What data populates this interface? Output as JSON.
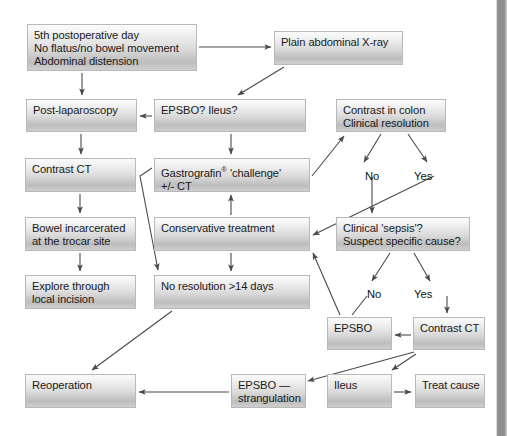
{
  "diagram": {
    "width": 507,
    "height": 436,
    "box_fill_top": "#fbfbfb",
    "box_fill_bottom": "#bdbdbd",
    "box_border": "#b9b9b9",
    "line_color": "#555555",
    "background": "#ffffff",
    "nodes": [
      {
        "id": "n1",
        "label": "5th postoperative day\nNo flatus/no bowel movement\nAbdominal distension",
        "x": 27,
        "y": 24,
        "w": 170,
        "h": 47
      },
      {
        "id": "n2",
        "label": "Plain abdominal X-ray",
        "x": 274,
        "y": 31,
        "w": 129,
        "h": 34
      },
      {
        "id": "n3",
        "label": "Post-laparoscopy",
        "x": 26,
        "y": 99,
        "w": 111,
        "h": 33
      },
      {
        "id": "n4",
        "label": "EPSBO? Ileus?",
        "x": 154,
        "y": 99,
        "w": 152,
        "h": 33
      },
      {
        "id": "n5",
        "label": "Contrast in colon\nClinical resolution",
        "x": 336,
        "y": 99,
        "w": 110,
        "h": 33
      },
      {
        "id": "n6",
        "label": "Contrast CT",
        "x": 25,
        "y": 158,
        "w": 111,
        "h": 34
      },
      {
        "id": "n7",
        "label": "Gastrografin® 'challenge'\n+/- CT",
        "x": 154,
        "y": 158,
        "w": 156,
        "h": 34,
        "sup": true
      },
      {
        "id": "n8",
        "label": "Bowel incarcerated\nat the trocar site",
        "x": 25,
        "y": 217,
        "w": 111,
        "h": 34
      },
      {
        "id": "n9",
        "label": "Conservative treatment",
        "x": 154,
        "y": 217,
        "w": 156,
        "h": 34
      },
      {
        "id": "n10",
        "label": "Clinical 'sepsis'?\nSuspect specific cause?",
        "x": 336,
        "y": 217,
        "w": 134,
        "h": 34
      },
      {
        "id": "n11",
        "label": "Explore through\nlocal incision",
        "x": 25,
        "y": 275,
        "w": 111,
        "h": 34
      },
      {
        "id": "n12",
        "label": "No resolution >14 days",
        "x": 154,
        "y": 275,
        "w": 156,
        "h": 34
      },
      {
        "id": "n13",
        "label": "EPSBO",
        "x": 327,
        "y": 317,
        "w": 65,
        "h": 33
      },
      {
        "id": "n14",
        "label": "Contrast CT",
        "x": 413,
        "y": 317,
        "w": 72,
        "h": 33
      },
      {
        "id": "n15",
        "label": "Reoperation",
        "x": 25,
        "y": 374,
        "w": 111,
        "h": 34
      },
      {
        "id": "n16",
        "label": "EPSBO —\nstrangulation",
        "x": 231,
        "y": 374,
        "w": 75,
        "h": 34
      },
      {
        "id": "n17",
        "label": "Ileus",
        "x": 327,
        "y": 374,
        "w": 65,
        "h": 34
      },
      {
        "id": "n18",
        "label": "Treat cause",
        "x": 415,
        "y": 374,
        "w": 70,
        "h": 34
      }
    ],
    "edge_labels": [
      {
        "id": "l1",
        "text": "No",
        "x": 365,
        "y": 170
      },
      {
        "id": "l2",
        "text": "Yes",
        "x": 414,
        "y": 170
      },
      {
        "id": "l3",
        "text": "No",
        "x": 367,
        "y": 288
      },
      {
        "id": "l4",
        "text": "Yes",
        "x": 414,
        "y": 288
      }
    ],
    "edges": [
      {
        "id": "e1",
        "from": "n1",
        "to": "n2",
        "path": "M 199,47 L 271,47",
        "arrow": "end"
      },
      {
        "id": "e2",
        "from": "n1",
        "to": "n3",
        "path": "M 82,73 L 82,95",
        "arrow": "end"
      },
      {
        "id": "e3",
        "from": "n2",
        "to": "n4",
        "path": "M 284,67 L 238,95",
        "arrow": "end"
      },
      {
        "id": "e4",
        "from": "n4",
        "to": "n3",
        "path": "M 152,116 L 140,116",
        "arrow": "end"
      },
      {
        "id": "e5",
        "from": "n3",
        "to": "n6",
        "path": "M 81,134 L 81,154",
        "arrow": "end"
      },
      {
        "id": "e6",
        "from": "n4",
        "to": "n7",
        "path": "M 231,134 L 231,154",
        "arrow": "end"
      },
      {
        "id": "e7",
        "from": "n6",
        "to": "n8",
        "path": "M 80,194 L 80,213",
        "arrow": "end"
      },
      {
        "id": "e8",
        "from": "n8",
        "to": "n11",
        "path": "M 80,253 L 80,271",
        "arrow": "end"
      },
      {
        "id": "e9",
        "from": "n7",
        "to": "n5",
        "path": "M 312,176 L 344,136",
        "arrow": "end"
      },
      {
        "id": "e10",
        "from": "n9",
        "to": "n7",
        "path": "M 231,215 L 231,195",
        "arrow": "end"
      },
      {
        "id": "e11",
        "from": "n9",
        "to": "n12",
        "path": "M 231,253 L 231,271",
        "arrow": "end"
      },
      {
        "id": "e12",
        "from": "n7",
        "to": "n12",
        "path": "M 152,168 L 140,176 L 158,270",
        "arrow": "end"
      },
      {
        "id": "e13",
        "from": "n5",
        "to": "l1",
        "path": "M 381,134 L 364,162",
        "arrow": "end"
      },
      {
        "id": "e14",
        "from": "n5",
        "to": "l2",
        "path": "M 408,134 L 427,162",
        "arrow": "end"
      },
      {
        "id": "e15",
        "from": "l1",
        "to": "n10",
        "path": "M 372,177 L 372,213",
        "arrow": "end"
      },
      {
        "id": "e16",
        "from": "l2",
        "to": "n9",
        "path": "M 434,176 L 313,235",
        "arrow": "end"
      },
      {
        "id": "e17",
        "from": "n10",
        "to": "l3",
        "path": "M 390,253 L 372,281",
        "arrow": "end"
      },
      {
        "id": "e18",
        "from": "n10",
        "to": "l4",
        "path": "M 414,253 L 430,281",
        "arrow": "end"
      },
      {
        "id": "e19",
        "from": "l3",
        "to": "n13",
        "path": "M 367,296 L 352,315",
        "arrow": "none"
      },
      {
        "id": "e20",
        "from": "l4",
        "to": "n14",
        "path": "M 447,296 L 447,313",
        "arrow": "end"
      },
      {
        "id": "e21",
        "from": "n14",
        "to": "n13",
        "path": "M 411,335 L 395,335",
        "arrow": "end"
      },
      {
        "id": "e22",
        "from": "n14",
        "to": "n16",
        "path": "M 414,352 L 308,381",
        "arrow": "end"
      },
      {
        "id": "e23",
        "from": "n14",
        "to": "n17",
        "path": "M 416,354 L 392,370",
        "arrow": "end"
      },
      {
        "id": "e24",
        "from": "n17",
        "to": "n18",
        "path": "M 394,392 L 411,392",
        "arrow": "end"
      },
      {
        "id": "e25",
        "from": "n12",
        "to": "n15",
        "path": "M 172,311 L 92,370",
        "arrow": "end"
      },
      {
        "id": "e26",
        "from": "n16",
        "to": "n15",
        "path": "M 229,392 L 139,392",
        "arrow": "end"
      },
      {
        "id": "e27",
        "from": "n13",
        "to": "n9",
        "path": "M 340,315 L 313,253",
        "arrow": "end"
      }
    ]
  }
}
